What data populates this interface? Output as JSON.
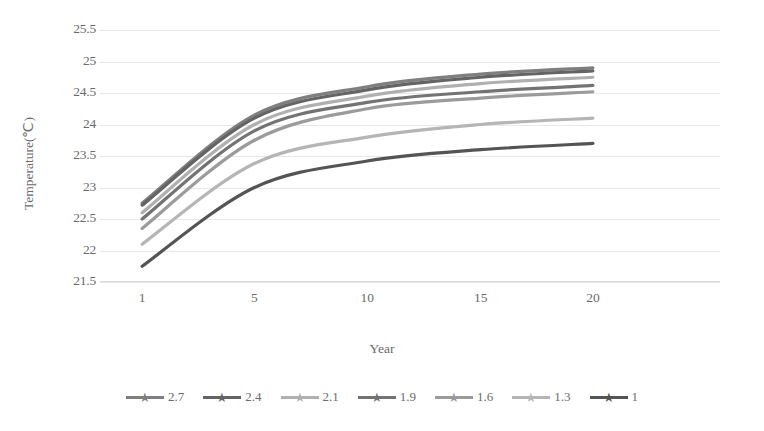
{
  "chart_data": {
    "type": "line",
    "title": "",
    "xlabel": "Year",
    "ylabel": "Temperature(℃)",
    "x": [
      1,
      5,
      10,
      15,
      20
    ],
    "x_tick_labels": [
      "1",
      "5",
      "10",
      "15",
      "20"
    ],
    "y_tick_labels": [
      "25.5",
      "25",
      "24.5",
      "24",
      "23.5",
      "23",
      "22.5",
      "22",
      "21.5"
    ],
    "y_ticks": [
      25.5,
      25,
      24.5,
      24,
      23.5,
      23,
      22.5,
      22,
      21.5
    ],
    "ylim": [
      21.5,
      25.5
    ],
    "grid": true,
    "grid_axis": "y",
    "legend_position": "bottom",
    "marker": "star",
    "series": [
      {
        "name": "2.7",
        "values": [
          22.75,
          24.15,
          24.6,
          24.8,
          24.9
        ],
        "color": "#7f7f7f"
      },
      {
        "name": "2.4",
        "values": [
          22.72,
          24.1,
          24.55,
          24.75,
          24.85
        ],
        "color": "#646464"
      },
      {
        "name": "2.1",
        "values": [
          22.6,
          24.0,
          24.45,
          24.65,
          24.75
        ],
        "color": "#b0b0b0"
      },
      {
        "name": "1.9",
        "values": [
          22.5,
          23.9,
          24.35,
          24.52,
          24.62
        ],
        "color": "#737373"
      },
      {
        "name": "1.6",
        "values": [
          22.35,
          23.75,
          24.25,
          24.42,
          24.52
        ],
        "color": "#9b9b9b"
      },
      {
        "name": "1.3",
        "values": [
          22.1,
          23.38,
          23.8,
          24.0,
          24.1
        ],
        "color": "#b5b5b5"
      },
      {
        "name": "1",
        "values": [
          21.75,
          23.0,
          23.42,
          23.6,
          23.7
        ],
        "color": "#545454"
      }
    ]
  },
  "legend": {
    "items": [
      {
        "label": "2.7",
        "color": "#7f7f7f"
      },
      {
        "label": "2.4",
        "color": "#646464"
      },
      {
        "label": "2.1",
        "color": "#b0b0b0"
      },
      {
        "label": "1.9",
        "color": "#737373"
      },
      {
        "label": "1.6",
        "color": "#9b9b9b"
      },
      {
        "label": "1.3",
        "color": "#b5b5b5"
      },
      {
        "label": "1",
        "color": "#545454"
      }
    ]
  }
}
